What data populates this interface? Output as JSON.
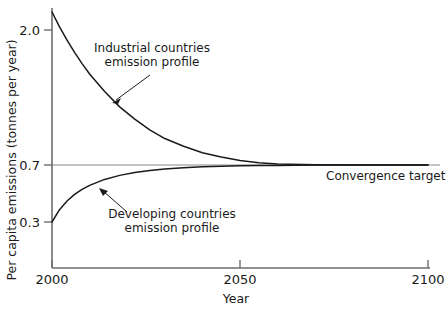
{
  "chart_data": {
    "type": "line",
    "title": "",
    "xlabel": "Year",
    "ylabel": "Per capita emissions (tonnes per year)",
    "xlim": [
      2000,
      2100
    ],
    "ylim": [
      0.2,
      2.3
    ],
    "xticks": [
      "2000",
      "2050",
      "2100"
    ],
    "xtick_values": [
      2000,
      2050,
      2100
    ],
    "yticks": [
      "2.0",
      "0.7",
      "0.3"
    ],
    "ytick_values": [
      2.0,
      0.7,
      0.3
    ],
    "grid": false,
    "legend": "none",
    "convergence_value": 0.7,
    "series": [
      {
        "name": "Industrial countries emission profile",
        "start_year": 2000,
        "start_value": 2.3,
        "end_year": 2100,
        "end_value": 0.7,
        "x": [
          2000,
          2002,
          2004,
          2006,
          2008,
          2010,
          2014,
          2018,
          2022,
          2026,
          2030,
          2035,
          2040,
          2045,
          2050,
          2055,
          2060,
          2070,
          2080,
          2090,
          2100
        ],
        "values": [
          2.3,
          2.05,
          1.85,
          1.68,
          1.54,
          1.42,
          1.24,
          1.1,
          1.0,
          0.92,
          0.86,
          0.81,
          0.77,
          0.745,
          0.725,
          0.713,
          0.706,
          0.701,
          0.7,
          0.7,
          0.7
        ]
      },
      {
        "name": "Developing countries emission profile",
        "start_year": 2000,
        "start_value": 0.3,
        "end_year": 2100,
        "end_value": 0.7,
        "x": [
          2000,
          2002,
          2004,
          2006,
          2008,
          2010,
          2014,
          2018,
          2022,
          2026,
          2030,
          2035,
          2040,
          2045,
          2050,
          2055,
          2060,
          2070,
          2080,
          2090,
          2100
        ],
        "values": [
          0.3,
          0.36,
          0.41,
          0.452,
          0.487,
          0.517,
          0.565,
          0.6,
          0.626,
          0.645,
          0.659,
          0.672,
          0.681,
          0.687,
          0.691,
          0.694,
          0.696,
          0.699,
          0.7,
          0.7,
          0.7
        ]
      },
      {
        "name": "Convergence target",
        "type": "horizontal-line",
        "value": 0.7
      }
    ],
    "annotations": [
      {
        "id": "industrial",
        "line1": "Industrial countries",
        "line2": "emission profile",
        "arrow_from": [
          2026,
          1.5
        ],
        "arrow_to": [
          2014,
          1.18
        ]
      },
      {
        "id": "developing",
        "line1": "Developing countries",
        "line2": "emission profile",
        "arrow_from": [
          2021,
          0.362
        ],
        "arrow_to": [
          2008,
          0.464
        ]
      },
      {
        "id": "convergence",
        "line1": "Convergence target"
      }
    ],
    "colors": {
      "curve": "#1a1a1a",
      "axis": "#6e6e6e",
      "convergence_line": "#8a8a8a",
      "text": "#1a1a1a",
      "background": "#ffffff"
    }
  }
}
